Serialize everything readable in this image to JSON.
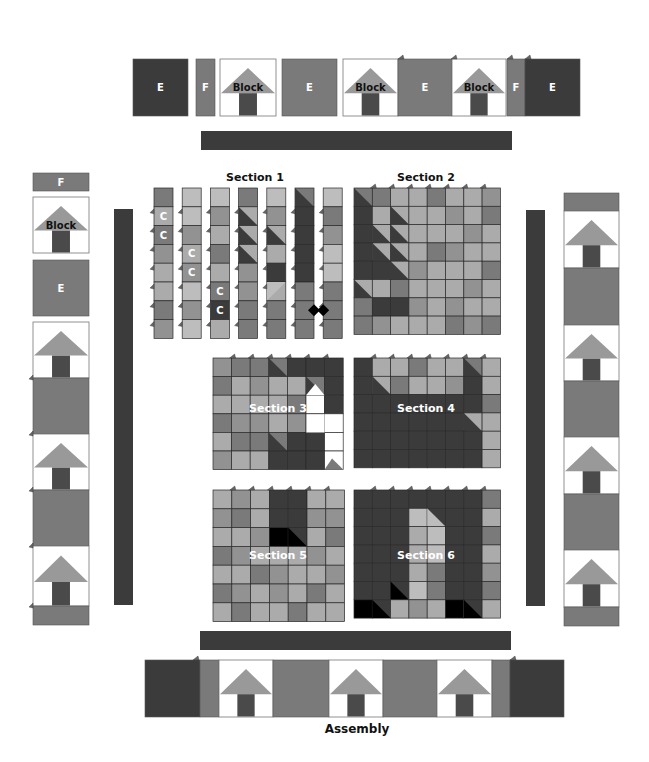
{
  "colors": {
    "dark": "#3b3b3b",
    "mid": "#7a7a7a",
    "medlight": "#929292",
    "light": "#ababab",
    "pale": "#bdbdbd",
    "black": "#000000",
    "white": "#ffffff",
    "house_roof": "#999999",
    "house_door": "#4a4a4a",
    "grid_line": "#2a2a2a"
  },
  "labels": {
    "section1": "Section 1",
    "section2": "Section 2",
    "section3": "Section 3",
    "section4": "Section 4",
    "section5": "Section 5",
    "section6": "Section 6",
    "assembly": "Assembly",
    "block": "Block",
    "E": "E",
    "F": "F",
    "C": "C"
  },
  "top_row": [
    {
      "type": "E",
      "x": 133,
      "w": 55,
      "color": "dark",
      "label": "E"
    },
    {
      "type": "F",
      "x": 196,
      "w": 19,
      "color": "mid",
      "label": "F"
    },
    {
      "type": "block",
      "x": 220,
      "w": 56,
      "label": "Block"
    },
    {
      "type": "E",
      "x": 282,
      "w": 55,
      "color": "mid",
      "label": "E"
    },
    {
      "type": "block",
      "x": 343,
      "w": 55,
      "label": "Block"
    },
    {
      "type": "E",
      "x": 398,
      "w": 54,
      "color": "mid",
      "label": "E"
    },
    {
      "type": "block",
      "x": 452,
      "w": 54,
      "label": "Block"
    },
    {
      "type": "F",
      "x": 507,
      "w": 18,
      "color": "mid",
      "label": "F"
    },
    {
      "type": "E",
      "x": 525,
      "w": 55,
      "color": "dark",
      "label": "E"
    }
  ],
  "left_column": [
    {
      "type": "F",
      "y": 173,
      "h": 18,
      "color": "mid",
      "label": "F"
    },
    {
      "type": "block",
      "y": 197,
      "h": 56,
      "label": "Block"
    },
    {
      "type": "E",
      "y": 260,
      "h": 56,
      "color": "mid",
      "label": "E"
    },
    {
      "type": "house",
      "y": 322,
      "h": 56
    },
    {
      "type": "E",
      "y": 378,
      "h": 56,
      "color": "mid",
      "label": ""
    },
    {
      "type": "house",
      "y": 434,
      "h": 56
    },
    {
      "type": "E",
      "y": 490,
      "h": 56,
      "color": "mid",
      "label": ""
    },
    {
      "type": "house",
      "y": 546,
      "h": 60
    },
    {
      "type": "F",
      "y": 606,
      "h": 19,
      "color": "mid",
      "label": ""
    }
  ],
  "right_column": [
    {
      "type": "F",
      "y": 193,
      "h": 18,
      "color": "mid"
    },
    {
      "type": "house",
      "y": 211,
      "h": 57
    },
    {
      "type": "E",
      "y": 268,
      "h": 57,
      "color": "mid"
    },
    {
      "type": "house",
      "y": 325,
      "h": 56
    },
    {
      "type": "E",
      "y": 381,
      "h": 56,
      "color": "mid"
    },
    {
      "type": "house",
      "y": 437,
      "h": 57
    },
    {
      "type": "E",
      "y": 494,
      "h": 56,
      "color": "mid"
    },
    {
      "type": "house",
      "y": 550,
      "h": 57
    },
    {
      "type": "F",
      "y": 607,
      "h": 19,
      "color": "mid"
    }
  ],
  "bottom_row": [
    {
      "type": "E",
      "x": 145,
      "w": 55,
      "color": "dark"
    },
    {
      "type": "F",
      "x": 200,
      "w": 19,
      "color": "mid"
    },
    {
      "type": "house",
      "x": 219,
      "w": 54
    },
    {
      "type": "E",
      "x": 273,
      "w": 56,
      "color": "mid"
    },
    {
      "type": "house",
      "x": 329,
      "w": 54
    },
    {
      "type": "E",
      "x": 383,
      "w": 54,
      "color": "mid"
    },
    {
      "type": "house",
      "x": 437,
      "w": 55
    },
    {
      "type": "F",
      "x": 492,
      "w": 18,
      "color": "mid"
    },
    {
      "type": "E",
      "x": 510,
      "w": 54,
      "color": "dark"
    }
  ],
  "sashing": [
    {
      "name": "top-sashing",
      "x": 201,
      "y": 131,
      "w": 311,
      "h": 19
    },
    {
      "name": "left-sashing",
      "x": 114,
      "y": 209,
      "w": 19,
      "h": 396
    },
    {
      "name": "right-sashing",
      "x": 526,
      "y": 210,
      "w": 19,
      "h": 396
    },
    {
      "name": "bottom-sashing",
      "x": 200,
      "y": 631,
      "w": 311,
      "h": 19
    }
  ],
  "section1": {
    "x": 154,
    "y": 188,
    "strip_w": 19,
    "strip_gap": 9.2,
    "cell_h": 18.8,
    "strips": [
      [
        "mid",
        "light",
        "mid",
        "medlight",
        "light",
        "light",
        "mid",
        "medlight"
      ],
      [
        "pale",
        "pale",
        "medlight",
        "light",
        "medlight",
        "pale",
        "medlight",
        "pale"
      ],
      [
        "pale",
        "medlight",
        "light",
        "mid",
        "light",
        "mid",
        "dark",
        "light"
      ],
      [
        "mid",
        "diagA",
        "diagA",
        "diagA",
        "medlight",
        "medlight",
        "mid",
        "mid"
      ],
      [
        "pale",
        "medlight",
        "diagA",
        "light",
        "dark",
        "diagB",
        "mid",
        "mid"
      ],
      [
        "diagC",
        "dark",
        "dark",
        "dark",
        "dark",
        "mid",
        "mid",
        "mid"
      ],
      [
        "pale",
        "mid",
        "medlight",
        "pale",
        "pale",
        "mid",
        "mid",
        "mid"
      ]
    ],
    "c_marks": [
      [
        0,
        1
      ],
      [
        0,
        2
      ],
      [
        1,
        3
      ],
      [
        1,
        4
      ],
      [
        2,
        5
      ],
      [
        2,
        6
      ]
    ]
  },
  "section2": {
    "x": 354,
    "y": 188,
    "cols": 8,
    "rows": 8,
    "cell": 18.3,
    "cells": [
      [
        "diagC",
        "mid",
        "light",
        "light",
        "mid",
        "light",
        "light",
        "medlight"
      ],
      [
        "dark",
        "light",
        "diagA",
        "light",
        "light",
        "medlight",
        "light",
        "mid"
      ],
      [
        "dark",
        "diagA",
        "diagA",
        "light",
        "light",
        "light",
        "medlight",
        "light"
      ],
      [
        "dark",
        "diagA",
        "diagA",
        "light",
        "mid",
        "medlight",
        "light",
        "light"
      ],
      [
        "dark",
        "dark",
        "diagA",
        "medlight",
        "light",
        "light",
        "light",
        "mid"
      ],
      [
        "diagA",
        "light",
        "mid",
        "light",
        "light",
        "light",
        "medlight",
        "light"
      ],
      [
        "mid",
        "dark",
        "dark",
        "medlight",
        "light",
        "medlight",
        "light",
        "light"
      ],
      [
        "mid",
        "medlight",
        "light",
        "light",
        "light",
        "mid",
        "medlight",
        "mid"
      ]
    ]
  },
  "section3": {
    "x": 213,
    "y": 358,
    "cols": 7,
    "rows": 6,
    "cell": 18.6,
    "cells": [
      [
        "medlight",
        "mid",
        "mid",
        "diagC",
        "dark",
        "dark",
        "dark"
      ],
      [
        "mid",
        "light",
        "medlight",
        "light",
        "light",
        "diagC",
        "dark"
      ],
      [
        "light",
        "light",
        "light",
        "light",
        "mid",
        "white",
        "dark"
      ],
      [
        "mid",
        "medlight",
        "medlight",
        "light",
        "medlight",
        "white",
        "white"
      ],
      [
        "light",
        "mid",
        "mid",
        "diagC",
        "dark",
        "dark",
        "white"
      ],
      [
        "medlight",
        "light",
        "light",
        "dark",
        "dark",
        "dark",
        "white"
      ]
    ]
  },
  "section4": {
    "x": 354,
    "y": 358,
    "cols": 8,
    "rows": 6,
    "cell": 18.3,
    "cells": [
      [
        "dark",
        "light",
        "light",
        "mid",
        "light",
        "light",
        "diagC",
        "light"
      ],
      [
        "dark",
        "diagA",
        "mid",
        "light",
        "light",
        "medlight",
        "dark",
        "light"
      ],
      [
        "dark",
        "dark",
        "dark",
        "dark",
        "dark",
        "dark",
        "dark",
        "mid"
      ],
      [
        "dark",
        "dark",
        "dark",
        "dark",
        "dark",
        "dark",
        "diagA",
        "light"
      ],
      [
        "dark",
        "dark",
        "dark",
        "dark",
        "dark",
        "dark",
        "dark",
        "light"
      ],
      [
        "dark",
        "dark",
        "dark",
        "dark",
        "dark",
        "dark",
        "dark",
        "light"
      ]
    ]
  },
  "section5": {
    "x": 213,
    "y": 490,
    "cols": 7,
    "rows": 7,
    "cell": 18.8,
    "cells": [
      [
        "light",
        "medlight",
        "light",
        "dark",
        "dark",
        "light",
        "light"
      ],
      [
        "medlight",
        "mid",
        "light",
        "dark",
        "dark",
        "medlight",
        "medlight"
      ],
      [
        "light",
        "light",
        "medlight",
        "black",
        "blackdiag",
        "light",
        "mid"
      ],
      [
        "mid",
        "medlight",
        "light",
        "light",
        "light",
        "medlight",
        "light"
      ],
      [
        "light",
        "light",
        "mid",
        "medlight",
        "light",
        "light",
        "medlight"
      ],
      [
        "mid",
        "medlight",
        "light",
        "medlight",
        "light",
        "mid",
        "light"
      ],
      [
        "light",
        "mid",
        "light",
        "light",
        "mid",
        "light",
        "light"
      ]
    ]
  },
  "section6": {
    "x": 354,
    "y": 490,
    "cols": 8,
    "rows": 7,
    "cell": 18.3,
    "cells": [
      [
        "dark",
        "dark",
        "dark",
        "dark",
        "dark",
        "dark",
        "dark",
        "mid"
      ],
      [
        "dark",
        "dark",
        "dark",
        "pale",
        "diagP",
        "dark",
        "dark",
        "light"
      ],
      [
        "dark",
        "dark",
        "dark",
        "light",
        "pale",
        "dark",
        "dark",
        "mid"
      ],
      [
        "dark",
        "dark",
        "dark",
        "light",
        "pale",
        "dark",
        "dark",
        "light"
      ],
      [
        "dark",
        "dark",
        "dark",
        "light",
        "mid",
        "dark",
        "dark",
        "medlight"
      ],
      [
        "dark",
        "dark",
        "blackdiag",
        "pale",
        "mid",
        "dark",
        "dark",
        "mid"
      ],
      [
        "black",
        "blackdiag",
        "light",
        "medlight",
        "light",
        "black",
        "blackdiag",
        "light"
      ]
    ]
  }
}
